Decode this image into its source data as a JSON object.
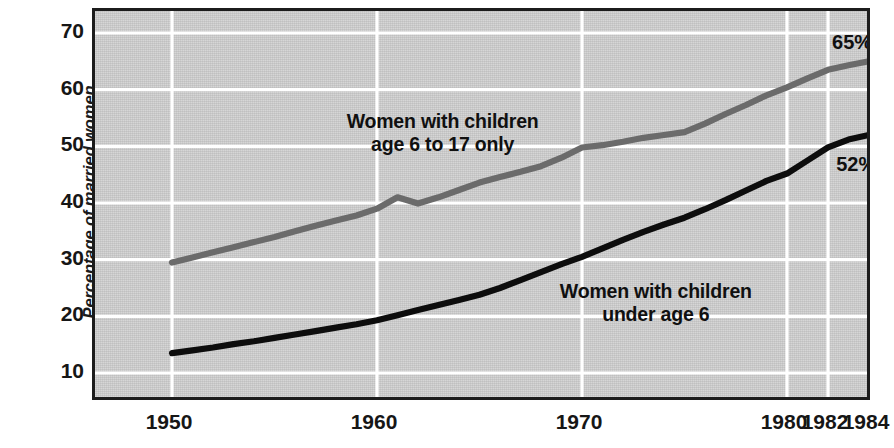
{
  "chart_data": {
    "type": "line",
    "title": "",
    "subtitle": "",
    "xlabel": "",
    "ylabel": "Percentage of married women in the labor force",
    "ylabel_line1": "Percentage of married women",
    "ylabel_line2": "in the labor force",
    "xlim": [
      1950,
      1984
    ],
    "ylim": [
      4,
      73
    ],
    "grid": true,
    "legend_position": "inline-annotations",
    "y_ticks": [
      70,
      60,
      50,
      40,
      30,
      20,
      10
    ],
    "y_tick_labels": [
      "70",
      "60",
      "50",
      "40",
      "30",
      "20",
      "10"
    ],
    "x_ticks": [
      1950,
      1960,
      1970,
      1980,
      1982,
      1984
    ],
    "x_tick_labels": [
      "1950",
      "1960",
      "1970",
      "1980",
      "1982",
      "1984"
    ],
    "series": [
      {
        "name": "Women with children age 6 to 17 only",
        "label_line1": "Women with children",
        "label_line2": "age 6 to 17 only",
        "color": "#6b6b6b",
        "end_value_label": "65%",
        "x": [
          1950,
          1951,
          1952,
          1953,
          1954,
          1955,
          1956,
          1957,
          1958,
          1959,
          1960,
          1961,
          1962,
          1963,
          1964,
          1965,
          1966,
          1967,
          1968,
          1969,
          1970,
          1971,
          1972,
          1973,
          1974,
          1975,
          1976,
          1977,
          1978,
          1979,
          1980,
          1981,
          1982,
          1983,
          1984
        ],
        "values": [
          29.5,
          30.4,
          31.3,
          32.2,
          33.1,
          34.0,
          35.0,
          36.0,
          36.9,
          37.8,
          39.0,
          41.0,
          39.9,
          41.0,
          42.3,
          43.6,
          44.6,
          45.5,
          46.5,
          48.0,
          49.8,
          50.2,
          50.8,
          51.5,
          52.0,
          52.5,
          54.0,
          55.7,
          57.3,
          59.0,
          60.4,
          62.0,
          63.5,
          64.3,
          65.0
        ]
      },
      {
        "name": "Women with children under age 6",
        "label_line1": "Women with children",
        "label_line2": "under age 6",
        "color": "#0d0d0d",
        "end_value_label": "52%",
        "x": [
          1950,
          1951,
          1952,
          1953,
          1954,
          1955,
          1956,
          1957,
          1958,
          1959,
          1960,
          1961,
          1962,
          1963,
          1964,
          1965,
          1966,
          1967,
          1968,
          1969,
          1970,
          1971,
          1972,
          1973,
          1974,
          1975,
          1976,
          1977,
          1978,
          1979,
          1980,
          1981,
          1982,
          1983,
          1984
        ],
        "values": [
          13.5,
          14.0,
          14.5,
          15.1,
          15.6,
          16.2,
          16.8,
          17.4,
          18.0,
          18.6,
          19.3,
          20.2,
          21.1,
          22.0,
          22.9,
          23.8,
          25.0,
          26.4,
          27.8,
          29.2,
          30.5,
          32.0,
          33.5,
          34.9,
          36.2,
          37.4,
          38.9,
          40.5,
          42.2,
          43.9,
          45.2,
          47.5,
          49.8,
          51.2,
          52.0
        ]
      }
    ],
    "annotations": [
      {
        "text": "65%",
        "x": 1983,
        "y": 68.5
      },
      {
        "text": "52%",
        "x": 1983,
        "y": 48.0
      }
    ],
    "colors": {
      "plot_background": "#c9c9c9",
      "gridline": "#ffffff",
      "axis_border": "#1c1c1c",
      "page_background": "#ffffff",
      "text": "#161616",
      "series_1": "#6b6b6b",
      "series_2": "#0d0d0d"
    }
  }
}
